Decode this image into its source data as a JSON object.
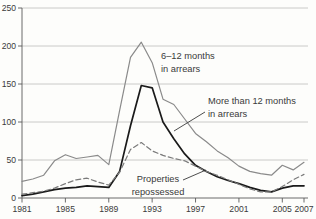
{
  "chart_data": {
    "type": "line",
    "title": "",
    "xlabel": "",
    "ylabel": "",
    "x_range": [
      1981,
      2007
    ],
    "ylim": [
      0,
      250
    ],
    "yticks": [
      0,
      50,
      100,
      150,
      200,
      250
    ],
    "xticks": [
      1981,
      1985,
      1989,
      1993,
      1997,
      2001,
      2005,
      2007
    ],
    "grid": "horizontal-only",
    "legend": "inline-annotations",
    "categories": [
      1981,
      1982,
      1983,
      1984,
      1985,
      1986,
      1987,
      1988,
      1989,
      1990,
      1991,
      1992,
      1993,
      1994,
      1995,
      1996,
      1997,
      1998,
      1999,
      2000,
      2001,
      2002,
      2003,
      2004,
      2005,
      2006,
      2007
    ],
    "series": [
      {
        "name": "6–12 months in arrears",
        "style": "solid",
        "color": "#8a8a8a",
        "width": 1.2,
        "values": [
          22,
          25,
          30,
          49,
          57,
          52,
          54,
          56,
          44,
          115,
          185,
          205,
          178,
          130,
          123,
          104,
          85,
          74,
          62,
          53,
          42,
          35,
          32,
          30,
          43,
          37,
          47
        ]
      },
      {
        "name": "More than 12 months in arrears",
        "style": "solid",
        "color": "#1a1a1a",
        "width": 1.7,
        "values": [
          3,
          5,
          8,
          11,
          13,
          14,
          16,
          15,
          14,
          35,
          95,
          148,
          145,
          100,
          78,
          58,
          43,
          35,
          28,
          23,
          19,
          14,
          10,
          8,
          13,
          16,
          16
        ]
      },
      {
        "name": "Properties repossessed",
        "style": "dashed",
        "color": "#7a7a7a",
        "width": 1.2,
        "values": [
          5,
          7,
          9,
          13,
          19,
          24,
          26,
          21,
          17,
          34,
          64,
          73,
          62,
          56,
          52,
          49,
          42,
          35,
          30,
          24,
          18,
          12,
          8,
          8,
          15,
          24,
          31
        ]
      }
    ],
    "annotations": [
      {
        "id": "label-6-12-months",
        "lines": [
          "6–12 months",
          "in arrears"
        ],
        "x": 161,
        "y": 59,
        "anchor": "start",
        "leader": null
      },
      {
        "id": "label-more-than-12-months",
        "lines": [
          "More than 12 months",
          "in arrears"
        ],
        "x": 208,
        "y": 104,
        "anchor": "start",
        "leader": [
          205,
          112,
          174,
          131
        ]
      },
      {
        "id": "label-properties-repossessed",
        "lines": [
          "Properties",
          "repossessed"
        ],
        "x": 158,
        "y": 182,
        "anchor": "middle",
        "leader": [
          183,
          180,
          206,
          170
        ]
      }
    ],
    "colors": {
      "background": "#fdfdfb",
      "gridline": "#bcbcbc",
      "axis": "#5a5a5a",
      "text": "#3a3a3a"
    }
  }
}
